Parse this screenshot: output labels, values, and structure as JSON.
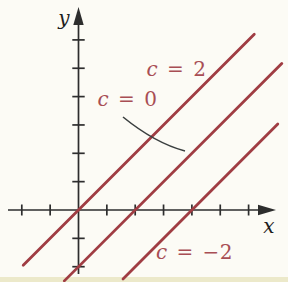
{
  "figure": {
    "width": 288,
    "height": 282,
    "background": "#fcfbf5",
    "bottom_edge_tint": "#e9e5c2",
    "axis_color": "#2d2d2d",
    "line_color": "#a03d43",
    "annotation_color": "#a84e54",
    "leader_color": "#3a3f3f"
  },
  "chart_data": {
    "type": "line",
    "title": "",
    "xlabel": "x",
    "ylabel": "y",
    "xlim": [
      -2.5,
      7.3
    ],
    "ylim": [
      -2.6,
      7.2
    ],
    "grid": false,
    "x_ticks": [
      -2,
      -1,
      1,
      2,
      3,
      4,
      5,
      6
    ],
    "y_ticks": [
      -2,
      -1,
      1,
      2,
      3,
      4,
      5,
      6
    ],
    "tick_labels_shown": false,
    "series": [
      {
        "label": "c = 2",
        "slope": 1,
        "x_intercept": 0,
        "y_intercept": 0,
        "x_range": [
          -1.95,
          6.2
        ]
      },
      {
        "label": "c = 0",
        "slope": 1,
        "x_intercept": 2,
        "y_intercept": -2,
        "x_range": [
          -0.5,
          7.17
        ]
      },
      {
        "label": "c = −2",
        "slope": 1,
        "x_intercept": 4,
        "y_intercept": -4,
        "x_range": [
          1.57,
          7.03
        ]
      }
    ],
    "annotations": [
      {
        "text": "c = 2",
        "series": 0,
        "text_px": [
          176.5,
          76
        ]
      },
      {
        "text": "c = 0",
        "series": 1,
        "text_px": [
          127.5,
          106
        ],
        "leader_path_px": [
          [
            123,
            117
          ],
          [
            155,
            143
          ],
          [
            185,
            151
          ]
        ]
      },
      {
        "text": "c = −2",
        "series": 2,
        "text_px": [
          194.5,
          259
        ]
      }
    ],
    "axes": {
      "origin_px": [
        78.5,
        210
      ],
      "unit_px": 28.35,
      "x_axis": {
        "line_from_px": 8,
        "line_to_px": 261,
        "arrow_tip_px": 276,
        "label_px": [
          269,
          232.5
        ]
      },
      "y_axis": {
        "line_from_px": 274,
        "line_to_px": 24,
        "arrow_tip_px": 7,
        "label_px": [
          64,
          24.5
        ]
      }
    }
  }
}
